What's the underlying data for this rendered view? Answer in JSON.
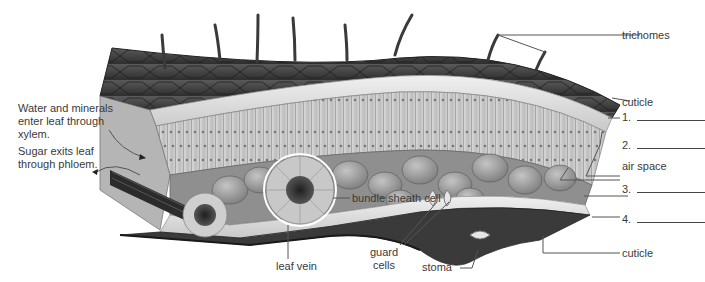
{
  "diagram": {
    "colors": {
      "background": "#ffffff",
      "cuticle_dark": "#3c3c3c",
      "epidermis": "#dcdcdc",
      "palisade": "#c9c9c9",
      "spongy": "#a9a9a9",
      "label_text": "#3a3a3a",
      "leader_line": "#555555"
    },
    "left_annotations": {
      "xylem": {
        "lines": [
          "Water and minerals",
          "enter leaf through",
          "xylem."
        ]
      },
      "phloem": {
        "lines": [
          "Sugar exits leaf",
          "through phloem."
        ]
      }
    },
    "right_labels": {
      "trichomes": "trichomes",
      "cuticle_top": "cuticle",
      "blank_1": "1.",
      "blank_2": "2.",
      "air_space": "air space",
      "blank_3": "3.",
      "blank_4": "4.",
      "cuticle_bottom": "cuticle"
    },
    "inner_labels": {
      "bundle_sheath": "bundle sheath cell",
      "leaf_vein": "leaf vein",
      "guard_cells": [
        "guard",
        "cells"
      ],
      "stoma": "stoma"
    }
  }
}
